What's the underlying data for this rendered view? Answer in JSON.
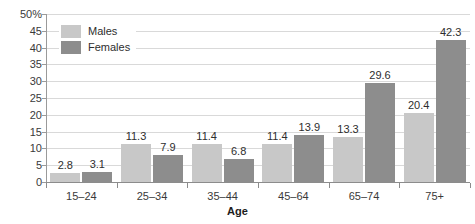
{
  "chart_data": {
    "type": "bar",
    "title": "",
    "xlabel": "Age",
    "ylabel": "",
    "categories": [
      "15–24",
      "25–34",
      "35–44",
      "45–64",
      "65–74",
      "75+"
    ],
    "series": [
      {
        "name": "Males",
        "color": "#c8c8c8",
        "values": [
          2.8,
          11.3,
          11.4,
          11.4,
          13.3,
          20.4
        ]
      },
      {
        "name": "Females",
        "color": "#8d8d8d",
        "values": [
          3.1,
          7.9,
          6.8,
          13.9,
          29.6,
          42.3
        ]
      }
    ],
    "ylim": [
      0,
      50
    ],
    "ytick_step": 5,
    "ytick_labels": [
      "50%",
      "45",
      "40",
      "35",
      "30",
      "25",
      "20",
      "15",
      "10",
      "5",
      "0"
    ],
    "ytick_values": [
      50,
      45,
      40,
      35,
      30,
      25,
      20,
      15,
      10,
      5,
      0
    ],
    "grid": true,
    "grid_axis": "y",
    "legend_position": "top-left",
    "value_labels": true,
    "value_labels_text": [
      [
        "2.8",
        "3.1"
      ],
      [
        "11.3",
        "7.9"
      ],
      [
        "11.4",
        "6.8"
      ],
      [
        "11.4",
        "13.9"
      ],
      [
        "13.3",
        "29.6"
      ],
      [
        "20.4",
        "42.3"
      ]
    ]
  },
  "legend": {
    "items": [
      {
        "label": "Males"
      },
      {
        "label": "Females"
      }
    ]
  }
}
